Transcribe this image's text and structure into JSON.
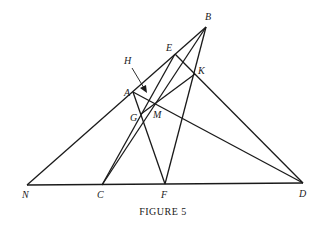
{
  "caption": "FIGURE 5",
  "labels": {
    "B": "B",
    "E": "E",
    "H": "H",
    "K": "K",
    "A": "A",
    "G": "G",
    "M": "M",
    "N": "N",
    "C": "C",
    "F": "F",
    "D": "D"
  },
  "points": {
    "B": [
      206,
      27
    ],
    "E": [
      175,
      54
    ],
    "K": [
      195,
      74
    ],
    "A": [
      133,
      92
    ],
    "G": [
      141,
      114
    ],
    "M": [
      155,
      105
    ],
    "N": [
      27,
      185
    ],
    "C": [
      102,
      185
    ],
    "F": [
      165,
      184
    ],
    "D": [
      303,
      183
    ]
  },
  "segments": [
    [
      "N",
      "B"
    ],
    [
      "N",
      "D"
    ],
    [
      "A",
      "D"
    ],
    [
      "A",
      "F"
    ],
    [
      "B",
      "F"
    ],
    [
      "B",
      "C"
    ],
    [
      "E",
      "C"
    ],
    [
      "E",
      "D"
    ],
    [
      "K",
      "G"
    ]
  ],
  "annotation": {
    "from": [
      132,
      68
    ],
    "to": [
      146,
      92
    ],
    "label": "H"
  }
}
